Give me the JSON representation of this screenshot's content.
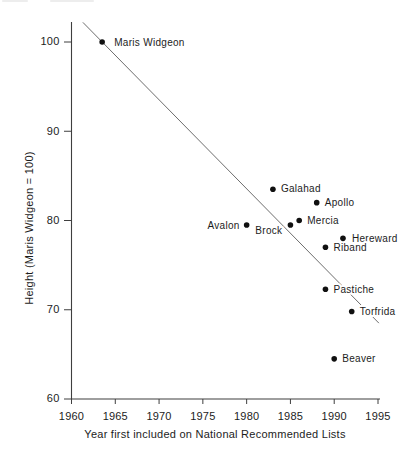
{
  "figure": {
    "background_color": "#ffffff",
    "axis_color": "#3f3f3f",
    "trend_line_color": "#5c5c5c",
    "point_color": "#101010",
    "text_color": "#1c1c1c"
  },
  "chart_data": {
    "type": "scatter",
    "title": "",
    "xlabel": "Year first included on National Recommended Lists",
    "ylabel": "Height (Maris Widgeon = 100)",
    "xlim": [
      1960,
      1995
    ],
    "ylim": [
      60,
      100
    ],
    "x_ticks": [
      1960,
      1965,
      1970,
      1975,
      1980,
      1985,
      1990,
      1995
    ],
    "y_ticks": [
      60,
      70,
      80,
      90,
      100
    ],
    "grid": false,
    "legend": "none",
    "points": [
      {
        "name": "Maris Widgeon",
        "year": 1963.5,
        "height": 100,
        "label_side": "right",
        "dx": 12,
        "dy": 1
      },
      {
        "name": "Galahad",
        "year": 1983,
        "height": 83.5,
        "label_side": "right",
        "dx": 8,
        "dy": 0
      },
      {
        "name": "Apollo",
        "year": 1988,
        "height": 82,
        "label_side": "right",
        "dx": 8,
        "dy": 1
      },
      {
        "name": "Mercia",
        "year": 1986,
        "height": 80,
        "label_side": "right",
        "dx": 8,
        "dy": 1
      },
      {
        "name": "Avalon",
        "year": 1980,
        "height": 79.5,
        "label_side": "left",
        "dx": -7,
        "dy": 1
      },
      {
        "name": "Brock",
        "year": 1985,
        "height": 79.5,
        "label_side": "left",
        "dx": -8,
        "dy": 6
      },
      {
        "name": "Hereward",
        "year": 1991,
        "height": 78,
        "label_side": "right",
        "dx": 9,
        "dy": 1
      },
      {
        "name": "Riband",
        "year": 1989,
        "height": 77,
        "label_side": "right",
        "dx": 8,
        "dy": 1
      },
      {
        "name": "Pastiche",
        "year": 1989,
        "height": 72.3,
        "label_side": "right",
        "dx": 8,
        "dy": 1
      },
      {
        "name": "Torfrida",
        "year": 1992,
        "height": 69.8,
        "label_side": "right",
        "dx": 8,
        "dy": 1
      },
      {
        "name": "Beaver",
        "year": 1990,
        "height": 64.5,
        "label_side": "right",
        "dx": 8,
        "dy": 1
      }
    ],
    "trend_line": {
      "x1": 1961.3,
      "y1": 102.2,
      "x2": 1995.1,
      "y2": 68.5,
      "note": "downward regression line, interrupted by Pastiche and Torfrida labels"
    }
  }
}
